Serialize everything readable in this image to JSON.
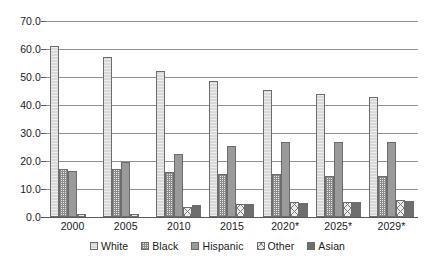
{
  "chart_data": {
    "type": "bar",
    "title": "",
    "subtitle": "",
    "xlabel": "",
    "ylabel": "",
    "ylim": [
      0.0,
      70.0
    ],
    "ytick_step": 10.0,
    "ytick_labels": [
      "70.0",
      "60.0",
      "50.0",
      "40.0",
      "30.0",
      "20.0",
      "10.0",
      "0.0"
    ],
    "grid": true,
    "legend_position": "bottom",
    "categories": [
      "2000",
      "2005",
      "2010",
      "2015",
      "2020*",
      "2025*",
      "2029*"
    ],
    "series": [
      {
        "name": "White",
        "color": "#d8d8d8",
        "pattern": "light-dotted",
        "values": [
          61.0,
          57.0,
          52.0,
          48.5,
          45.5,
          43.8,
          42.8
        ]
      },
      {
        "name": "Black",
        "color": "#ebebeb",
        "pattern": "fine-dotted",
        "values": [
          17.0,
          17.2,
          16.0,
          15.3,
          15.2,
          14.8,
          14.8
        ]
      },
      {
        "name": "Hispanic",
        "color": "#9a9a9a",
        "pattern": "solid-gray",
        "values": [
          16.3,
          19.7,
          22.5,
          25.2,
          26.8,
          26.8,
          26.8
        ]
      },
      {
        "name": "Other",
        "color": "#ededed",
        "pattern": "crosshatch",
        "values": [
          1.2,
          1.2,
          3.5,
          4.6,
          5.2,
          5.5,
          6.0
        ]
      },
      {
        "name": "Asian",
        "color": "#6e6e6e",
        "pattern": "dark-solid",
        "values": [
          0.0,
          0.0,
          4.3,
          4.8,
          5.0,
          5.2,
          5.7
        ]
      }
    ]
  },
  "legend": {
    "items": [
      {
        "label": "White"
      },
      {
        "label": "Black"
      },
      {
        "label": "Hispanic"
      },
      {
        "label": "Other"
      },
      {
        "label": "Asian"
      }
    ]
  }
}
